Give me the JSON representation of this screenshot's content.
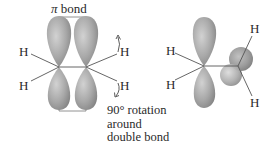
{
  "diagram": {
    "left": {
      "bond_label_symbol": "π",
      "bond_label_text": " bond",
      "hydrogens": [
        "H",
        "H",
        "H",
        "H"
      ],
      "caption_lines": [
        "90° rotation",
        "around",
        "double bond"
      ]
    },
    "right": {
      "hydrogens": [
        "H",
        "H",
        "H",
        "H"
      ]
    },
    "colors": {
      "lobe_light": "#c8c8c8",
      "lobe_mid": "#9e9e9e",
      "lobe_dark": "#7a7a7a",
      "line": "#555555",
      "arrow": "#4a4a4a",
      "text": "#2a2a2a"
    }
  }
}
